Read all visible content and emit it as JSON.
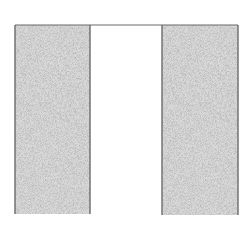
{
  "diagram": {
    "type": "two stippled columns joined by a top line",
    "colors": {
      "background": "#ffffff",
      "outline": "#6a6a6a",
      "stipple_dark": "#7a7a7a",
      "stipple_light": "#d8d8d8"
    },
    "shapes": [
      {
        "name": "left-column",
        "x": 15,
        "y": 25,
        "width": 75,
        "height": 189,
        "fill": "stipple"
      },
      {
        "name": "gap",
        "x": 90,
        "y": 25,
        "width": 72,
        "height": 189,
        "fill": "white"
      },
      {
        "name": "right-column",
        "x": 162,
        "y": 25,
        "width": 76,
        "height": 190,
        "fill": "stipple"
      }
    ],
    "top_line": {
      "x1": 15,
      "x2": 238,
      "y": 25
    }
  }
}
